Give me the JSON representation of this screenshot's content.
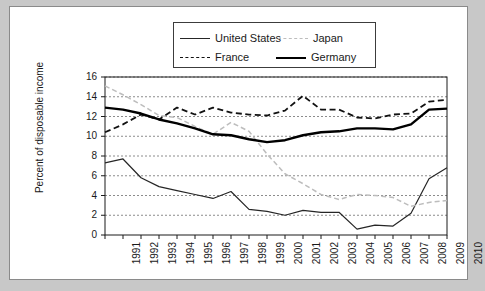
{
  "chart_data": {
    "type": "line",
    "title": "",
    "xlabel": "",
    "ylabel": "Percent of disposable income",
    "x": [
      1991,
      1992,
      1993,
      1994,
      1995,
      1996,
      1997,
      1998,
      1999,
      2000,
      2001,
      2002,
      2003,
      2004,
      2005,
      2006,
      2007,
      2008,
      2009,
      2010
    ],
    "xlim": [
      1991,
      2010
    ],
    "ylim": [
      0,
      16
    ],
    "ytick_labels": [
      "0",
      "2",
      "4",
      "6",
      "8",
      "10",
      "12",
      "14",
      "16"
    ],
    "ytick_values": [
      0,
      2,
      4,
      6,
      8,
      10,
      12,
      14,
      16
    ],
    "xtick_labels": [
      "1991",
      "1992",
      "1993",
      "1994",
      "1995",
      "1996",
      "1997",
      "1998",
      "1999",
      "2000",
      "2001",
      "2002",
      "2003",
      "2004",
      "2005",
      "2006",
      "2007",
      "2008",
      "2009",
      "2010"
    ],
    "grid": "horizontal-dashed",
    "legend_position": "top-center",
    "series": [
      {
        "name": "United States",
        "color": "#262626",
        "style": "solid",
        "width": 1.2,
        "values": [
          7.3,
          7.7,
          5.8,
          4.9,
          4.5,
          4.1,
          3.7,
          4.4,
          2.6,
          2.4,
          2.0,
          2.5,
          2.3,
          2.3,
          0.6,
          1.0,
          0.9,
          2.2,
          5.7,
          6.8
        ]
      },
      {
        "name": "Japan",
        "color": "#bdbdbd",
        "style": "dashed",
        "width": 1.5,
        "values": [
          15.1,
          14.2,
          13.2,
          12.1,
          11.9,
          11.0,
          10.2,
          11.4,
          10.5,
          8.2,
          6.2,
          5.2,
          4.1,
          3.6,
          4.1,
          4.0,
          3.8,
          2.9,
          3.3,
          3.5
        ]
      },
      {
        "name": "France",
        "color": "#111111",
        "style": "dashed",
        "width": 1.8,
        "values": [
          10.4,
          11.2,
          12.2,
          11.7,
          12.9,
          12.2,
          12.9,
          12.4,
          12.2,
          12.1,
          12.6,
          14.1,
          12.7,
          12.7,
          11.9,
          11.8,
          12.2,
          12.3,
          13.5,
          13.7
        ]
      },
      {
        "name": "Germany",
        "color": "#000000",
        "style": "solid",
        "width": 2.4,
        "values": [
          12.9,
          12.7,
          12.3,
          11.7,
          11.3,
          10.8,
          10.2,
          10.1,
          9.7,
          9.4,
          9.6,
          10.1,
          10.4,
          10.5,
          10.8,
          10.8,
          10.7,
          11.2,
          12.7,
          12.8
        ]
      }
    ]
  },
  "legend": {
    "entries": [
      {
        "label": "United States",
        "swatch": "us-line-swatch"
      },
      {
        "label": "Japan",
        "swatch": "japan-line-swatch"
      },
      {
        "label": "France",
        "swatch": "france-line-swatch"
      },
      {
        "label": "Germany",
        "swatch": "germany-line-swatch"
      }
    ]
  },
  "colors": {
    "figure_background": "#c8c8c8",
    "panel_background": "#ffffff",
    "gridline": "#6f6f6f",
    "axis": "#1a1a1a"
  }
}
